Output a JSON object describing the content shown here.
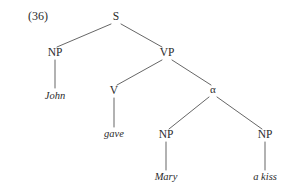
{
  "figure": {
    "example_number": "(36)",
    "type": "syntax-tree",
    "background_color": "#ffffff",
    "line_color": "#4a4a4a",
    "text_color": "#2b2b2b"
  },
  "nodes": {
    "s": {
      "label": "S",
      "x": 116,
      "y": 20
    },
    "np_subject": {
      "label": "NP",
      "x": 55,
      "y": 56
    },
    "vp": {
      "label": "VP",
      "x": 167,
      "y": 56
    },
    "v": {
      "label": "V",
      "x": 114,
      "y": 94
    },
    "alpha": {
      "label": "α",
      "x": 213,
      "y": 93
    },
    "np_indirect_object": {
      "label": "NP",
      "x": 166,
      "y": 138
    },
    "np_direct_object": {
      "label": "NP",
      "x": 265,
      "y": 138
    }
  },
  "terminals": {
    "john": {
      "label": "John",
      "x": 55,
      "y": 99
    },
    "gave": {
      "label": "gave",
      "x": 114,
      "y": 137
    },
    "mary": {
      "label": "Mary",
      "x": 166,
      "y": 180
    },
    "a_kiss": {
      "label": "a kiss",
      "x": 265,
      "y": 180
    }
  },
  "edges": [
    {
      "from": "S",
      "to": "NP",
      "x1": 111,
      "y1": 24,
      "x2": 57,
      "y2": 47
    },
    {
      "from": "S",
      "to": "VP",
      "x1": 121,
      "y1": 24,
      "x2": 162,
      "y2": 47
    },
    {
      "from": "VP",
      "to": "V",
      "x1": 162,
      "y1": 60,
      "x2": 117,
      "y2": 85
    },
    {
      "from": "VP",
      "to": "alpha",
      "x1": 172,
      "y1": 60,
      "x2": 211,
      "y2": 85
    },
    {
      "from": "alpha",
      "to": "NP-left",
      "x1": 209,
      "y1": 97,
      "x2": 169,
      "y2": 129
    },
    {
      "from": "alpha",
      "to": "NP-right",
      "x1": 217,
      "y1": 97,
      "x2": 262,
      "y2": 129
    }
  ],
  "stems": [
    {
      "node": "NP",
      "terminal": "John",
      "x": 55,
      "y1": 60,
      "y2": 88
    },
    {
      "node": "V",
      "terminal": "gave",
      "x": 114,
      "y1": 98,
      "y2": 127
    },
    {
      "node": "NP",
      "terminal": "Mary",
      "x": 166,
      "y1": 142,
      "y2": 170
    },
    {
      "node": "NP",
      "terminal": "a kiss",
      "x": 265,
      "y1": 142,
      "y2": 170
    }
  ]
}
